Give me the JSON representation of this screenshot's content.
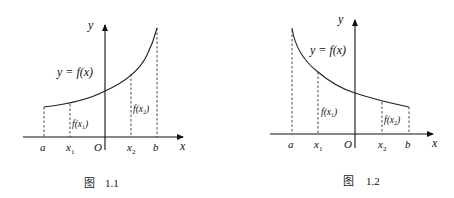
{
  "figures": [
    {
      "id": "fig-1-1",
      "caption_prefix": "图",
      "caption_number": "1.1",
      "function_label": "y = f(x)",
      "curve_trend": "increasing",
      "axis_labels": {
        "x": "x",
        "y": "y",
        "origin": "O"
      },
      "tick_labels": {
        "a": "a",
        "x1": "x",
        "x1_sub": "1",
        "x2": "x",
        "x2_sub": "2",
        "b": "b"
      },
      "value_labels": {
        "f_x1": "f(x",
        "f_x1_sub": "1",
        "f_x1_end": ")",
        "f_x2": "f(x",
        "f_x2_sub": "2",
        "f_x2_end": ")"
      }
    },
    {
      "id": "fig-1-2",
      "caption_prefix": "图",
      "caption_number": "1.2",
      "function_label": "y = f(x)",
      "curve_trend": "decreasing",
      "axis_labels": {
        "x": "x",
        "y": "y",
        "origin": "O"
      },
      "tick_labels": {
        "a": "a",
        "x1": "x",
        "x1_sub": "1",
        "x2": "x",
        "x2_sub": "2",
        "b": "b"
      },
      "value_labels": {
        "f_x1": "f(x",
        "f_x1_sub": "1",
        "f_x1_end": ")",
        "f_x2": "f(x",
        "f_x2_sub": "2",
        "f_x2_end": ")"
      }
    }
  ]
}
